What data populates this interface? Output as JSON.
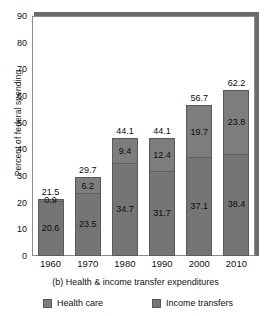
{
  "chart_data": {
    "type": "bar",
    "subtype": "stacked-bar",
    "title": "",
    "caption": "(b) Health & income transfer expenditures",
    "xlabel": "",
    "ylabel": "Percent of federal spending",
    "categories": [
      "1960",
      "1970",
      "1980",
      "1990",
      "2000",
      "2010"
    ],
    "ylim": [
      0,
      90
    ],
    "yticks": [
      0,
      10,
      20,
      30,
      40,
      50,
      60,
      70,
      80,
      90
    ],
    "ytick_labels": [
      "0",
      "10",
      "20",
      "30",
      "40",
      "50",
      "60",
      "70",
      "80",
      "90"
    ],
    "grid": false,
    "legend_position": "bottom",
    "series": [
      {
        "name": "Income transfers",
        "color": "#757575",
        "values": [
          20.6,
          23.5,
          34.7,
          31.7,
          37.1,
          38.4
        ]
      },
      {
        "name": "Health care",
        "color": "#7d7d7d",
        "values": [
          0.9,
          6.2,
          9.4,
          12.4,
          19.7,
          23.8
        ]
      }
    ],
    "totals": [
      21.5,
      29.7,
      44.1,
      44.1,
      56.7,
      62.2
    ],
    "total_labels": [
      "21.5",
      "29.7",
      "44.1",
      "44.1",
      "56.7",
      "62.2"
    ],
    "income_labels": [
      "20.6",
      "23.5",
      "34.7",
      "31.7",
      "37.1",
      "38.4"
    ],
    "health_labels": [
      "0.9",
      "6.2",
      "9.4",
      "12.4",
      "19.7",
      "23.8"
    ]
  },
  "legend": {
    "items": [
      {
        "label": "Health care",
        "color": "#7d7d7d"
      },
      {
        "label": "Income transfers",
        "color": "#757575"
      }
    ]
  },
  "colors": {
    "bar_income": "#757575",
    "bar_health": "#7d7d7d",
    "frame": "#8d8d8d",
    "frame_shadow": "#6b6b6b",
    "text": "#111111",
    "background": "#ffffff"
  }
}
